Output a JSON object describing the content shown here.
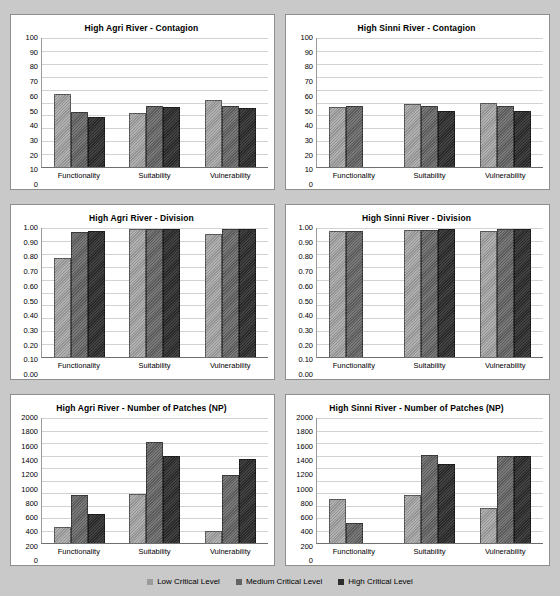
{
  "legend": {
    "position": "bottom",
    "items": [
      {
        "label": "Low Critical Level",
        "key": "low",
        "color": "#9b9b9b"
      },
      {
        "label": "Medium Critical Level",
        "key": "medium",
        "color": "#636363"
      },
      {
        "label": "High Critical Level",
        "key": "high",
        "color": "#2e2e2e"
      }
    ]
  },
  "chart_data": [
    {
      "id": "agri-contagion",
      "type": "bar",
      "title": "High Agri River -  Contagion",
      "xlabel": "",
      "ylabel": "",
      "ylim": [
        0,
        100
      ],
      "ytick_step": 10,
      "ytick_labels": [
        "100",
        "90",
        "80",
        "70",
        "60",
        "50",
        "40",
        "30",
        "20",
        "10",
        "0"
      ],
      "grid": true,
      "categories": [
        "Functionality",
        "Suitability",
        "Vulnerability"
      ],
      "series": [
        {
          "name": "Low Critical Level",
          "values": [
            56.5,
            42,
            52
          ]
        },
        {
          "name": "Medium Critical Level",
          "values": [
            43,
            47,
            47
          ]
        },
        {
          "name": "High Critical Level",
          "values": [
            38.5,
            46.5,
            45.5
          ]
        }
      ]
    },
    {
      "id": "sinni-contagion",
      "type": "bar",
      "title": "High Sinni River -  Contagion",
      "xlabel": "",
      "ylabel": "",
      "ylim": [
        0,
        100
      ],
      "ytick_step": 10,
      "ytick_labels": [
        "100",
        "90",
        "80",
        "70",
        "60",
        "50",
        "40",
        "30",
        "20",
        "10",
        "0"
      ],
      "grid": true,
      "categories": [
        "Functionality",
        "Suitability",
        "Vulnerability"
      ],
      "series": [
        {
          "name": "Low Critical Level",
          "values": [
            46.5,
            48.5,
            49.5
          ]
        },
        {
          "name": "Medium Critical Level",
          "values": [
            47.5,
            47,
            47.5
          ]
        },
        {
          "name": "High Critical Level",
          "values": [
            null,
            43.5,
            43.5
          ]
        }
      ]
    },
    {
      "id": "agri-division",
      "type": "bar",
      "title": "High Agri River -  Division",
      "xlabel": "",
      "ylabel": "",
      "ylim": [
        0,
        1
      ],
      "ytick_step": 0.1,
      "ytick_labels": [
        "1.00",
        "0.90",
        "0.80",
        "0.70",
        "0.60",
        "0.50",
        "0.40",
        "0.30",
        "0.20",
        "0.10",
        "0.00"
      ],
      "grid": true,
      "categories": [
        "Functionality",
        "Suitability",
        "Vulnerability"
      ],
      "series": [
        {
          "name": "Low Critical Level",
          "values": [
            0.77,
            0.99,
            0.955
          ]
        },
        {
          "name": "Medium Critical Level",
          "values": [
            0.97,
            0.99,
            0.99
          ]
        },
        {
          "name": "High Critical Level",
          "values": [
            0.98,
            0.99,
            0.99
          ]
        }
      ]
    },
    {
      "id": "sinni-division",
      "type": "bar",
      "title": "High Sinni River -  Division",
      "xlabel": "",
      "ylabel": "",
      "ylim": [
        0,
        1
      ],
      "ytick_step": 0.1,
      "ytick_labels": [
        "1.00",
        "0.90",
        "0.80",
        "0.70",
        "0.60",
        "0.50",
        "0.40",
        "0.30",
        "0.20",
        "0.10",
        "0.00"
      ],
      "grid": true,
      "categories": [
        "Functionality",
        "Suitability",
        "Vulnerability"
      ],
      "series": [
        {
          "name": "Low Critical Level",
          "values": [
            0.98,
            0.985,
            0.975
          ]
        },
        {
          "name": "Medium Critical Level",
          "values": [
            0.975,
            0.985,
            0.99
          ]
        },
        {
          "name": "High Critical Level",
          "values": [
            null,
            0.99,
            0.99
          ]
        }
      ]
    },
    {
      "id": "agri-np",
      "type": "bar",
      "title": "High Agri River -   Number of Patches (NP)",
      "xlabel": "",
      "ylabel": "",
      "ylim": [
        0,
        2000
      ],
      "ytick_step": 200,
      "ytick_labels": [
        "2000",
        "1800",
        "1600",
        "1400",
        "1200",
        "1000",
        "800",
        "600",
        "400",
        "200",
        "0"
      ],
      "grid": true,
      "categories": [
        "Functionality",
        "Suitability",
        "Vulnerability"
      ],
      "series": [
        {
          "name": "Low Critical Level",
          "values": [
            260,
            780,
            195
          ]
        },
        {
          "name": "Medium Critical Level",
          "values": [
            770,
            1615,
            1090
          ]
        },
        {
          "name": "High Critical Level",
          "values": [
            465,
            1395,
            1350
          ]
        }
      ]
    },
    {
      "id": "sinni-np",
      "type": "bar",
      "title": "High Sinni River  -  Number of Patches (NP)",
      "xlabel": "",
      "ylabel": "",
      "ylim": [
        0,
        2000
      ],
      "ytick_step": 200,
      "ytick_labels": [
        "2000",
        "1800",
        "1600",
        "1400",
        "1200",
        "1000",
        "800",
        "600",
        "400",
        "200",
        "0"
      ],
      "grid": true,
      "categories": [
        "Functionality",
        "Suitability",
        "Vulnerability"
      ],
      "series": [
        {
          "name": "Low Critical Level",
          "values": [
            710,
            770,
            560
          ]
        },
        {
          "name": "Medium Critical Level",
          "values": [
            315,
            1415,
            1400
          ]
        },
        {
          "name": "High Critical Level",
          "values": [
            null,
            1265,
            1390
          ]
        }
      ]
    }
  ]
}
